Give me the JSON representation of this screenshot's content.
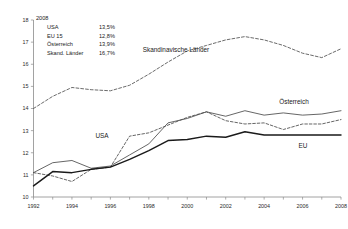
{
  "chart_data": {
    "type": "line",
    "title": "",
    "xlabel": "",
    "ylabel": "",
    "x": [
      1992,
      1993,
      1994,
      1995,
      1996,
      1997,
      1998,
      1999,
      2000,
      2001,
      2002,
      2003,
      2004,
      2005,
      2006,
      2007,
      2008
    ],
    "xlim": [
      1992,
      2008
    ],
    "ylim": [
      10,
      18
    ],
    "xticks": [
      "1992",
      "1994",
      "1996",
      "1998",
      "2000",
      "2002",
      "2004",
      "2006",
      "2008"
    ],
    "yticks": [
      "10",
      "11",
      "12",
      "13",
      "14",
      "15",
      "16",
      "17",
      "18"
    ],
    "grid": false,
    "legend_position": "inline-labels",
    "series": [
      {
        "name": "Skandinavische Länder",
        "style": "dashed",
        "values": [
          14.0,
          14.55,
          14.95,
          14.85,
          14.8,
          15.05,
          15.55,
          16.1,
          16.6,
          16.85,
          17.1,
          17.25,
          17.1,
          16.85,
          16.5,
          16.3,
          16.7
        ]
      },
      {
        "name": "USA",
        "style": "dashed",
        "values": [
          11.1,
          10.95,
          10.7,
          11.25,
          11.35,
          12.75,
          12.9,
          13.25,
          13.6,
          13.85,
          13.45,
          13.3,
          13.35,
          13.05,
          13.3,
          13.3,
          13.5
        ]
      },
      {
        "name": "Österreich",
        "style": "thin-solid",
        "values": [
          11.1,
          11.55,
          11.65,
          11.3,
          11.4,
          11.9,
          12.4,
          13.35,
          13.55,
          13.85,
          13.65,
          13.9,
          13.7,
          13.8,
          13.7,
          13.75,
          13.9
        ]
      },
      {
        "name": "EU",
        "style": "thick-solid",
        "values": [
          10.5,
          11.15,
          11.1,
          11.25,
          11.35,
          11.7,
          12.1,
          12.55,
          12.6,
          12.75,
          12.7,
          12.95,
          12.8,
          12.8,
          12.8,
          12.8,
          12.8
        ]
      }
    ],
    "annotations": [
      {
        "name": "skandinavische-laender-label",
        "text": "Skandinavische Länder",
        "x": 176,
        "y": 52
      },
      {
        "name": "oesterreich-label",
        "text": "Österreich",
        "x": 294,
        "y": 104
      },
      {
        "name": "usa-label",
        "text": "USA",
        "x": 102,
        "y": 138
      },
      {
        "name": "eu-label",
        "text": "EU",
        "x": 303,
        "y": 148
      }
    ]
  },
  "legend_box": {
    "year": "2008",
    "rows": [
      {
        "label": "USA",
        "value": "13,5%"
      },
      {
        "label": "EU 15",
        "value": "12,8%"
      },
      {
        "label": "Österreich",
        "value": "13,9%"
      },
      {
        "label": "Skand. Länder",
        "value": "16,7%"
      }
    ]
  },
  "colors": {
    "axis": "#8a8a8a",
    "text": "#1a1a1a",
    "line_thin": "#4a4a4a",
    "line_thick": "#1a1a1a",
    "background": "#ffffff"
  }
}
